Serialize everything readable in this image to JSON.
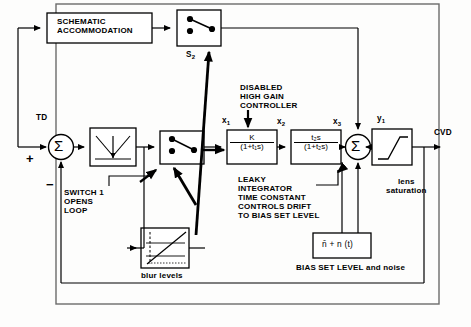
{
  "diagram": {
    "title_blocks": {
      "schematic_accommodation": "SCHEMATIC\nACCOMMODATION",
      "lens_saturation": "lens\nsaturation",
      "blur_levels": "blur levels",
      "noise_caption": "BIAS SET LEVEL and noise"
    },
    "switches": {
      "s2_label": "S",
      "s2_sub": "2"
    },
    "signals": {
      "td": "TD",
      "plus": "+",
      "minus": "−",
      "x1": "x",
      "x1s": "1",
      "x2": "x",
      "x2s": "2",
      "x3": "x",
      "x3s": "3",
      "y1": "y",
      "y1s": "1",
      "cvd": "CVD"
    },
    "annotations": {
      "disabled_controller": "DISABLED\nHIGH GAIN\nCONTROLLER",
      "switch_opens_loop": "SWITCH 1\nOPENS\nLOOP",
      "leaky_integrator": "LEAKY\nINTEGRATOR\nTIME CONSTANT\nCONTROLS DRIFT\nTO BIAS SET LEVEL"
    },
    "transfer_functions": {
      "gain_block": {
        "numerator": "K",
        "denominator": "(1+t₁s)"
      },
      "washout_block": {
        "numerator": "t₂s",
        "denominator": "(1+t₂s)"
      }
    },
    "noise_block": {
      "expression": "n̄ + n (t)"
    },
    "sum_symbol": "Σ",
    "colors": {
      "ink": "#000000",
      "paper": "#fdfdfc",
      "frame": "#6b6b6b"
    }
  }
}
